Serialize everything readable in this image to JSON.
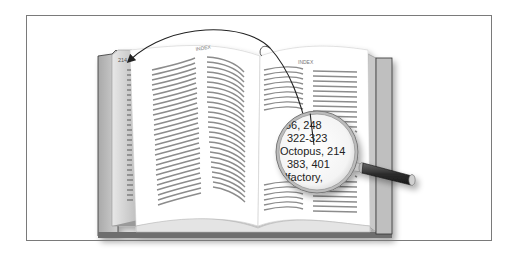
{
  "figure": {
    "left_page": {
      "page_number": "214",
      "header": "INDEX"
    },
    "right_page": {
      "header": "INDEX"
    },
    "magnifier": {
      "lines": [
        "66, 248",
        "322-323",
        "Octopus, 214",
        "383, 401",
        "olfactory,"
      ]
    },
    "colors": {
      "frame": "#7a7a7a",
      "text_lines": "#8c8c8c",
      "cover": "#b8b8b8",
      "handle": "#3c3c3c",
      "arrow": "#222222"
    }
  }
}
